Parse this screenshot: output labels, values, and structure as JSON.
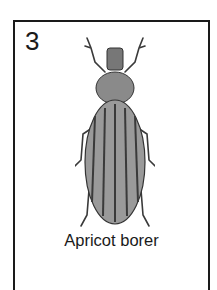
{
  "card": {
    "number": "3",
    "caption": "Apricot borer",
    "illustration": "beetle-illustration",
    "colors": {
      "border": "#1a1a1a",
      "body": "#8a8a8a",
      "stripe": "#3a3a3a",
      "background": "#ffffff"
    }
  }
}
